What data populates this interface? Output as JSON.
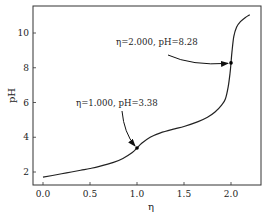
{
  "chart_data": {
    "type": "line",
    "title": "",
    "xlabel": "η",
    "ylabel": "pH",
    "xlim": [
      -0.11,
      2.33
    ],
    "ylim": [
      1.3,
      11.6
    ],
    "xticks": [
      0.0,
      0.5,
      1.0,
      1.5,
      2.0
    ],
    "xtick_labels": [
      "0.0",
      "0.5",
      "1.0",
      "1.5",
      "2.0"
    ],
    "yticks": [
      2,
      4,
      6,
      8,
      10
    ],
    "ytick_labels": [
      "2",
      "4",
      "6",
      "8",
      "10"
    ],
    "grid": false,
    "legend": null,
    "series": [
      {
        "name": "titration curve",
        "color": "#222222",
        "x": [
          0.0,
          0.1,
          0.25,
          0.4,
          0.5,
          0.6,
          0.75,
          0.85,
          0.95,
          1.0,
          1.05,
          1.14,
          1.25,
          1.4,
          1.5,
          1.65,
          1.75,
          1.83,
          1.9,
          1.94,
          1.97,
          1.99,
          2.0,
          2.01,
          2.03,
          2.06,
          2.1,
          2.15,
          2.2
        ],
        "y": [
          1.7,
          1.8,
          1.95,
          2.1,
          2.2,
          2.32,
          2.55,
          2.78,
          3.12,
          3.38,
          3.65,
          4.0,
          4.25,
          4.48,
          4.62,
          4.9,
          5.15,
          5.45,
          5.85,
          6.2,
          6.9,
          7.7,
          8.28,
          8.9,
          9.8,
          10.35,
          10.65,
          10.88,
          11.05
        ]
      }
    ],
    "annotations": [
      {
        "text": "η=1.000, pH=3.38",
        "point": [
          1.0,
          3.38
        ],
        "text_pos": [
          0.35,
          5.6
        ]
      },
      {
        "text": "η=2.000, pH=8.28",
        "point": [
          2.0,
          8.28
        ],
        "text_pos": [
          1.15,
          9.4
        ]
      }
    ],
    "markers": [
      {
        "x": 1.0,
        "y": 3.38
      },
      {
        "x": 2.0,
        "y": 8.28
      }
    ]
  },
  "labels": {
    "xlabel": "η",
    "ylabel": "pH",
    "annot1": "η=1.000, pH=3.38",
    "annot2": "η=2.000, pH=8.28"
  }
}
